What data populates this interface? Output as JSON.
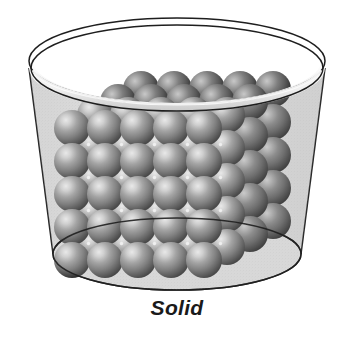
{
  "figure": {
    "title": "Solid",
    "caption": "Solid",
    "background_color": "#ffffff",
    "caption_color": "#1a1a1a"
  },
  "container": {
    "name": "beaker",
    "shape": "cylinder",
    "material": "transparent glass",
    "fill_color": "#dcdcdc",
    "outline_color": "#1e1e1e",
    "rim_highlight_color": "#f2f2f2",
    "outline_width": 1.4,
    "top_ellipse": {
      "cx": 177,
      "cy": 68,
      "rx": 148,
      "ry": 44
    },
    "rim_inner_ellipse": {
      "cx": 177,
      "cy": 75,
      "rx": 144,
      "ry": 42
    },
    "bottom_ellipse": {
      "cx": 177,
      "cy": 254,
      "rx": 124,
      "ry": 36
    },
    "wall_taper_px": 24
  },
  "lattice": {
    "name": "cubic close-packed sphere lattice",
    "description": "regularly ordered spheres packed in a fixed cubic arrangement",
    "front_columns": 5,
    "front_rows": 5,
    "depth_layers": 4,
    "sphere_diameter": 36,
    "spacing_x": 33,
    "spacing_y": 33,
    "depth_dx": 23,
    "depth_dy": -13,
    "origin_x": 72,
    "origin_y": 128,
    "sphere_base_color": "#7a7a7a",
    "sphere_highlight_color": "#e8e8e8",
    "sphere_mid_color": "#8c8c8c",
    "sphere_shadow_color": "#2a2a2a",
    "sphere_edge_color": "#1c1c1c",
    "interstice_dot_color": "#f4f4f4",
    "highlight_offset": {
      "x": -0.26,
      "y": -0.3
    }
  },
  "labels": {
    "caption_label": "Solid"
  }
}
